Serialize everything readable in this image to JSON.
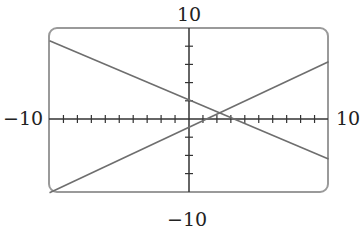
{
  "chart_data": {
    "type": "line",
    "title": "",
    "xlabel": "",
    "ylabel": "",
    "xlim": [
      -10,
      10
    ],
    "ylim": [
      -10,
      10
    ],
    "x_tick_step": 1,
    "y_tick_step": 2,
    "grid": false,
    "legend": null,
    "tick_labels": {
      "x_min": "−10",
      "x_max": "10",
      "y_min": "−10",
      "y_max": "10"
    },
    "series": [
      {
        "name": "line-decreasing",
        "x": [
          -10,
          10
        ],
        "y": [
          8.6,
          -4.4
        ],
        "slope": -0.65,
        "intercept": 2.1
      },
      {
        "name": "line-increasing",
        "x": [
          -10,
          10
        ],
        "y": [
          -8.1,
          6.3
        ],
        "slope": 0.72,
        "intercept": -0.9
      }
    ],
    "annotations": [
      {
        "type": "intersection",
        "x": 2.2,
        "y": 0.7
      }
    ]
  },
  "colors": {
    "frame": "#9a9a9a",
    "axis": "#333333",
    "line": "#6e6e6e"
  }
}
